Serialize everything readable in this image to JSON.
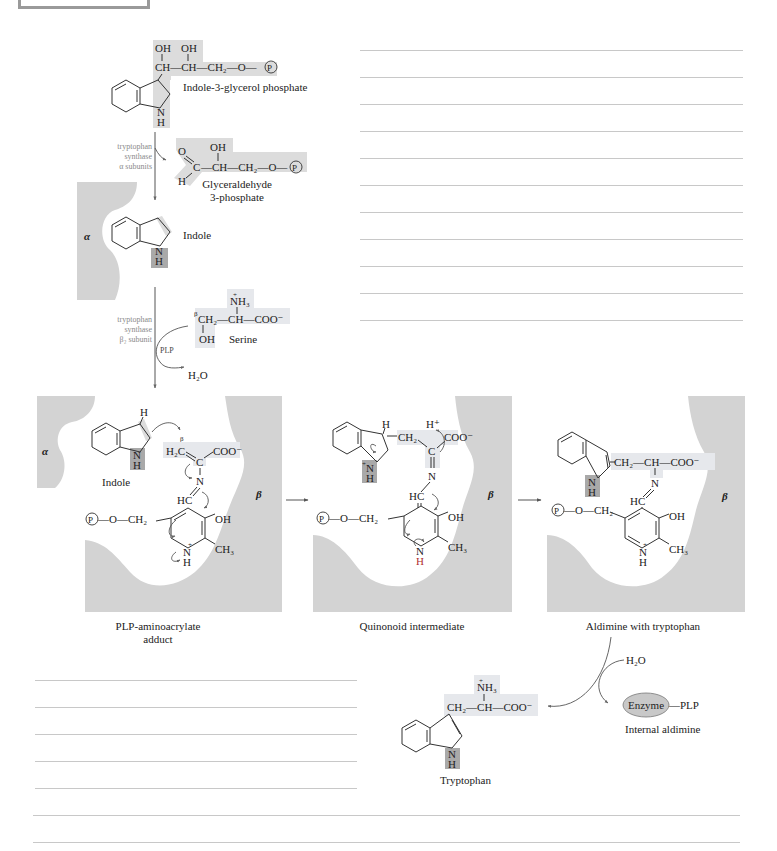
{
  "figure": {
    "top_section": {
      "indole_3_glycerol_phosphate": {
        "label": "Indole-3-glycerol phosphate",
        "chain": "CH—CH—CH₂—O—",
        "oh1": "OH",
        "oh2": "OH",
        "p_group": "P",
        "nh": "N",
        "h": "H"
      },
      "alpha_step": {
        "enzyme_lines": [
          "tryptophan",
          "synthase",
          "α subunits"
        ]
      },
      "glyceraldehyde_3_phosphate": {
        "label_line1": "Glyceraldehyde",
        "label_line2": "3-phosphate",
        "o": "O",
        "c": "C",
        "h": "H",
        "oh": "OH",
        "chain": "—CH—CH₂—O—",
        "p_group": "P"
      },
      "indole": {
        "label": "Indole",
        "nh": "N",
        "h": "H",
        "subunit": "α"
      },
      "beta_step": {
        "enzyme_lines": [
          "tryptophan",
          "synthase",
          "β₂ subunit"
        ],
        "cofactor": "PLP",
        "product": "H₂O"
      },
      "serine": {
        "label": "Serine",
        "nh3": "NH₃",
        "charge": "+",
        "beta": "β",
        "chain": "CH₂—CH—COO⁻",
        "oh": "OH"
      }
    },
    "panels": [
      {
        "caption_line1": "PLP-aminoacrylate",
        "caption_line2": "adduct",
        "alpha": "α",
        "beta": "β",
        "indole_label": "Indole",
        "h_top": "H",
        "beta_small": "β",
        "h2c": "H₂C",
        "c": "C",
        "coo": "COO⁻",
        "n": "N",
        "hc": "HC",
        "p_group": "P",
        "o_ch2": "—O—CH₂",
        "oh": "OH",
        "ring_n": "N",
        "ring_h": "H",
        "plus": "+",
        "ch3": "CH₃",
        "indole_n": "N",
        "indole_h": "H"
      },
      {
        "caption_line1": "Quinonoid intermediate",
        "beta": "β",
        "h_top": "H",
        "h_plus": "H⁺",
        "ch2": "CH₂",
        "c": "C",
        "coo": "COO⁻",
        "n": "N",
        "hc": "HC",
        "p_group": "P",
        "o_ch2": "—O—CH₂",
        "oh": "OH",
        "ring_n": "N",
        "ring_h": "H",
        "ch3": "CH₃",
        "indole_n": "N",
        "indole_h": "H",
        "plus": "+"
      },
      {
        "caption_line1": "Aldimine with tryptophan",
        "beta": "β",
        "chain": "CH₂—CH—COO⁻",
        "n": "N",
        "hc": "HC",
        "p_group": "P",
        "o_ch2": "—O—CH₂",
        "oh": "OH",
        "ring_n": "N",
        "ring_h": "H",
        "plus": "+",
        "ch3": "CH₃",
        "indole_n": "N",
        "indole_h": "H"
      }
    ],
    "bottom_section": {
      "water": "H₂O",
      "enzyme": "Enzyme",
      "plp": "—PLP",
      "internal_aldimine": "Internal aldimine",
      "tryptophan": {
        "label": "Tryptophan",
        "nh3": "NH₃",
        "plus": "+",
        "chain": "CH₂—CH—COO⁻",
        "n": "N",
        "h": "H"
      }
    },
    "colors": {
      "protein_fill": "#d3d3d3",
      "highlight": "#dcdcdc",
      "highlight_dark": "#a9a9a9",
      "rule_lines": "#c8c8c8"
    }
  },
  "note_lines": {
    "right_column_count": 11,
    "bottom_left_count": 5,
    "bottom_full_count": 2
  }
}
